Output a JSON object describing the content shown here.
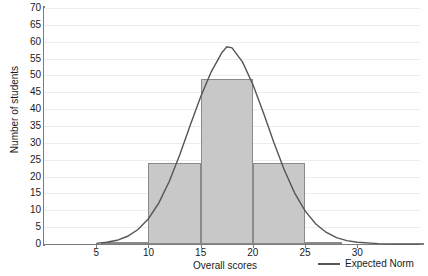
{
  "chart_data": {
    "type": "bar",
    "title": "",
    "xlabel": "Overall scores",
    "ylabel": "Number of students",
    "xlim": [
      0,
      36
    ],
    "ylim": [
      0,
      70
    ],
    "ytick_step": 5,
    "yticks": [
      0,
      5,
      10,
      15,
      20,
      25,
      30,
      35,
      40,
      45,
      50,
      55,
      60,
      65,
      70
    ],
    "xticks": [
      5,
      10,
      15,
      20,
      25,
      30
    ],
    "grid": true,
    "legend_position": "bottom-right",
    "bars": {
      "name": "Number of students",
      "bin_edges": [
        5.5,
        10,
        15,
        20,
        25,
        28.5
      ],
      "bin_labels": [
        "5.5-10",
        "10-15",
        "15-20",
        "20-25",
        "25-28.5"
      ],
      "values": [
        0,
        24,
        49,
        24,
        0.5
      ],
      "fill_color": "#c8c8c8",
      "edge_color": "#8a8a8a"
    },
    "series": [
      {
        "name": "Expected Norm",
        "type": "line",
        "color": "#555555",
        "mean": 17.5,
        "peak_value": 59,
        "x": [
          5,
          6,
          7,
          8,
          9,
          10,
          11,
          12,
          13,
          14,
          15,
          16,
          17,
          17.5,
          18,
          19,
          20,
          21,
          22,
          23,
          24,
          25,
          26,
          27,
          28,
          29,
          30,
          32,
          34,
          36
        ],
        "values": [
          0.2,
          0.5,
          1.1,
          2.3,
          4.3,
          7.5,
          12.2,
          18.6,
          26.5,
          35.2,
          43.7,
          51.0,
          56.6,
          58.5,
          58.2,
          54.0,
          47.3,
          39.0,
          30.2,
          22.0,
          15.1,
          9.8,
          6.0,
          3.5,
          1.9,
          1.0,
          0.5,
          0.1,
          0.0,
          0.0
        ]
      }
    ],
    "legend": [
      {
        "label": "Expected Norm",
        "marker": "line",
        "color": "#555555"
      }
    ]
  }
}
